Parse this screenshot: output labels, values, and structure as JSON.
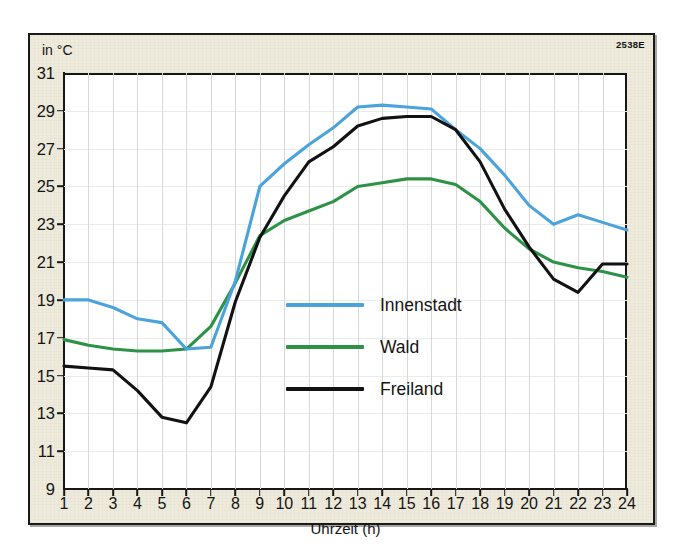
{
  "plate_code": "2538E",
  "unit_label": "in °C",
  "legend": {
    "items": [
      {
        "label": "Innenstadt",
        "color": "#4ba3dc",
        "swatch_name": "legend-swatch-innenstadt"
      },
      {
        "label": "Wald",
        "color": "#2e9246",
        "swatch_name": "legend-swatch-wald"
      },
      {
        "label": "Freiland",
        "color": "#121212",
        "swatch_name": "legend-swatch-freiland"
      }
    ]
  },
  "chart_data": {
    "type": "line",
    "title": "",
    "xlabel": "Uhrzeit (h)",
    "ylabel": "in °C",
    "grid": true,
    "legend_position": "center",
    "xlim": [
      1,
      24
    ],
    "ylim": [
      9,
      31
    ],
    "x": [
      1,
      2,
      3,
      4,
      5,
      6,
      7,
      8,
      9,
      10,
      11,
      12,
      13,
      14,
      15,
      16,
      17,
      18,
      19,
      20,
      21,
      22,
      23,
      24
    ],
    "categories": [
      "1",
      "2",
      "3",
      "4",
      "5",
      "6",
      "7",
      "8",
      "9",
      "10",
      "11",
      "12",
      "13",
      "14",
      "15",
      "16",
      "17",
      "18",
      "19",
      "20",
      "21",
      "22",
      "23",
      "24"
    ],
    "ytick_labels": [
      "9",
      "11",
      "13",
      "15",
      "17",
      "19",
      "21",
      "23",
      "25",
      "27",
      "29",
      "31"
    ],
    "ytick_values": [
      9,
      11,
      13,
      15,
      17,
      19,
      21,
      23,
      25,
      27,
      29,
      31
    ],
    "series": [
      {
        "name": "Innenstadt",
        "color": "#4ba3dc",
        "values": [
          19.0,
          19.0,
          18.6,
          18.0,
          17.8,
          16.4,
          16.5,
          20.0,
          25.0,
          26.2,
          27.2,
          28.1,
          29.2,
          29.3,
          29.2,
          29.1,
          28.0,
          27.0,
          25.6,
          24.0,
          23.0,
          23.5,
          23.1,
          22.7
        ]
      },
      {
        "name": "Wald",
        "color": "#2e9246",
        "values": [
          16.9,
          16.6,
          16.4,
          16.3,
          16.3,
          16.4,
          17.6,
          19.9,
          22.4,
          23.2,
          23.7,
          24.2,
          25.0,
          25.2,
          25.4,
          25.4,
          25.1,
          24.2,
          22.8,
          21.7,
          21.0,
          20.7,
          20.5,
          20.2
        ]
      },
      {
        "name": "Freiland",
        "color": "#121212",
        "values": [
          15.5,
          15.4,
          15.3,
          14.2,
          12.8,
          12.5,
          14.4,
          18.9,
          22.3,
          24.5,
          26.3,
          27.1,
          28.2,
          28.6,
          28.7,
          28.7,
          28.0,
          26.3,
          23.8,
          21.8,
          20.1,
          19.4,
          20.9,
          20.9
        ]
      }
    ]
  }
}
